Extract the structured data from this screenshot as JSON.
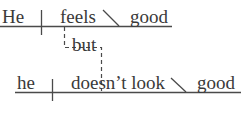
{
  "diagram": {
    "type": "sentence-diagram",
    "clause1": {
      "subject": "He",
      "verb": "feels",
      "complement": "good"
    },
    "conjunction": "but",
    "clause2": {
      "subject": "he",
      "verb": "doesn’t look",
      "complement": "good"
    }
  },
  "colors": {
    "line": "#4a4a4a",
    "text": "#3a3a3a"
  }
}
